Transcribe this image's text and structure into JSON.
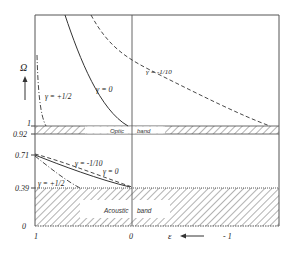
{
  "figure": {
    "y_axis": {
      "symbol": "Ω",
      "ticks": [
        "1",
        "0.92",
        "0.71",
        "0.39",
        "0"
      ]
    },
    "x_axis": {
      "symbol": "ε",
      "ticks": [
        "1",
        "0",
        "- 1"
      ]
    },
    "bands": {
      "optic": {
        "label_left": "Optic",
        "label_right": "band",
        "range": [
          0.92,
          1
        ]
      },
      "acoustic": {
        "label_left": "Acoustic",
        "label_right": "band",
        "range": [
          0,
          0.39
        ]
      }
    },
    "curves": [
      {
        "name": "γ = 0",
        "label": "γ = 0",
        "style": "solid"
      },
      {
        "name": "γ = -1/10",
        "label": "γ = -1/10",
        "style": "dashed"
      },
      {
        "name": "γ = +1/2",
        "label": "γ = +1/2",
        "style": "dash-dot"
      }
    ],
    "lower_labels": {
      "gamma_neg": "γ = -1/10",
      "gamma_zero": "γ = 0",
      "gamma_pos": "γ = +1/2"
    },
    "colors": {
      "line": "#333333",
      "hatch": "#555555",
      "background": "#ffffff"
    }
  }
}
